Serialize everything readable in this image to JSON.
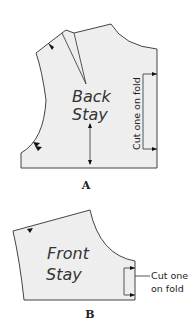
{
  "figures": [
    {
      "id": "A",
      "caption": "A",
      "piece_name_line1": "Back",
      "piece_name_line2": "Stay",
      "fold_note": "Cut one on fold",
      "features": [
        "shoulder-dart",
        "notch",
        "double-notch",
        "grainline-arrow",
        "fold-bracket"
      ]
    },
    {
      "id": "B",
      "caption": "B",
      "piece_name_line1": "Front",
      "piece_name_line2": "Stay",
      "fold_note_line1": "Cut one",
      "fold_note_line2": "on fold",
      "features": [
        "notch",
        "fold-bracket"
      ]
    }
  ],
  "colors": {
    "fill": "#eeeeee",
    "stroke": "#444444"
  }
}
